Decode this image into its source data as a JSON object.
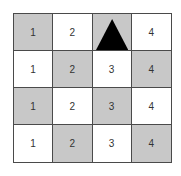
{
  "grid": {
    "rows": 4,
    "cols": 4,
    "colors": {
      "shaded": "#c8c8c8",
      "white": "#ffffff",
      "border": "#4a4a4a",
      "marker": "#000000"
    },
    "cells": [
      [
        {
          "label": "1",
          "shaded": true
        },
        {
          "label": "2",
          "shaded": false
        },
        {
          "label": "",
          "shaded": true,
          "marker": "triangle"
        },
        {
          "label": "4",
          "shaded": false
        }
      ],
      [
        {
          "label": "1",
          "shaded": false
        },
        {
          "label": "2",
          "shaded": true
        },
        {
          "label": "3",
          "shaded": false
        },
        {
          "label": "4",
          "shaded": true
        }
      ],
      [
        {
          "label": "1",
          "shaded": true
        },
        {
          "label": "2",
          "shaded": false
        },
        {
          "label": "3",
          "shaded": true
        },
        {
          "label": "4",
          "shaded": false
        }
      ],
      [
        {
          "label": "1",
          "shaded": false
        },
        {
          "label": "2",
          "shaded": true
        },
        {
          "label": "3",
          "shaded": false
        },
        {
          "label": "4",
          "shaded": true
        }
      ]
    ]
  }
}
